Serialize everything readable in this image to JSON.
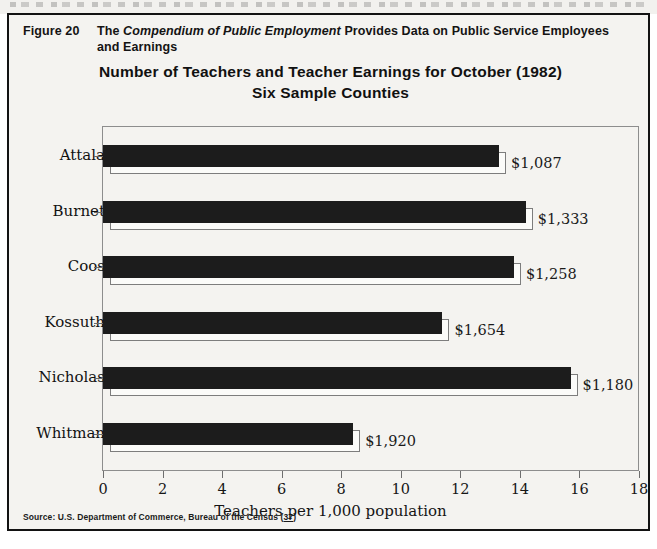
{
  "figure": {
    "number_label": "Figure 20",
    "caption_prefix": "The ",
    "caption_italic": "Compendium of Public Employment",
    "caption_suffix": " Provides Data on Public Service Employees and Earnings"
  },
  "chart_title": {
    "line1": "Number of Teachers and Teacher Earnings for October (1982)",
    "line2": "Six Sample Counties"
  },
  "source": {
    "text": "Source: U.S. Department of Commerce, Bureau of the Census (",
    "reference": "37",
    "close": ")"
  },
  "colors": {
    "bar_fill": "#1c1c1c",
    "bar_shadow": "#fbfbf9",
    "frame": "#121212",
    "plot_border": "#8d8d8d",
    "page_background": "#f4f3f0",
    "text": "#111111"
  },
  "chart_data": {
    "type": "bar",
    "orientation": "horizontal",
    "title": "Number of Teachers and Teacher Earnings for October (1982) Six Sample Counties",
    "xlabel": "Teachers per 1,000 population",
    "ylabel": "",
    "xlim": [
      0,
      18
    ],
    "xticks": [
      0,
      2,
      4,
      6,
      8,
      10,
      12,
      14,
      16,
      18
    ],
    "xtick_labels": [
      "0",
      "2",
      "4",
      "6",
      "8",
      "10",
      "12",
      "14",
      "16",
      "18"
    ],
    "grid": false,
    "legend": false,
    "categories": [
      "Attala",
      "Burnet",
      "Coos",
      "Kossuth",
      "Nicholas",
      "Whitman"
    ],
    "values": [
      13.3,
      14.2,
      13.8,
      11.4,
      15.7,
      8.4
    ],
    "annotations": [
      "$1,087",
      "$1,333",
      "$1,258",
      "$1,654",
      "$1,180",
      "$1,920"
    ],
    "annotation_label": "Average monthly earnings",
    "series": [
      {
        "name": "Teachers per 1,000 population",
        "values": [
          13.3,
          14.2,
          13.8,
          11.4,
          15.7,
          8.4
        ]
      }
    ],
    "points": [
      {
        "category": "Attala",
        "teachers_per_1000": 13.3,
        "earnings": "$1,087"
      },
      {
        "category": "Burnet",
        "teachers_per_1000": 14.2,
        "earnings": "$1,333"
      },
      {
        "category": "Coos",
        "teachers_per_1000": 13.8,
        "earnings": "$1,258"
      },
      {
        "category": "Kossuth",
        "teachers_per_1000": 11.4,
        "earnings": "$1,654"
      },
      {
        "category": "Nicholas",
        "teachers_per_1000": 15.7,
        "earnings": "$1,180"
      },
      {
        "category": "Whitman",
        "teachers_per_1000": 8.4,
        "earnings": "$1,920"
      }
    ]
  }
}
